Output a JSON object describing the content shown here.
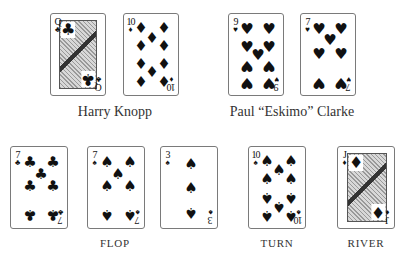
{
  "players": [
    {
      "name": "Harry Knopp",
      "cards": [
        {
          "rank": "Q",
          "suit": "clubs",
          "suit_glyph": "♣",
          "face": true
        },
        {
          "rank": "10",
          "suit": "diamonds",
          "suit_glyph": "♦",
          "face": false
        }
      ]
    },
    {
      "name": "Paul “Eskimo” Clarke",
      "cards": [
        {
          "rank": "9",
          "suit": "hearts",
          "suit_glyph": "♥",
          "face": false
        },
        {
          "rank": "7",
          "suit": "hearts",
          "suit_glyph": "♥",
          "face": false
        }
      ]
    }
  ],
  "board": {
    "flop": {
      "label": "FLOP",
      "cards": [
        {
          "rank": "7",
          "suit": "clubs",
          "suit_glyph": "♣"
        },
        {
          "rank": "7",
          "suit": "spades",
          "suit_glyph": "♠"
        },
        {
          "rank": "3",
          "suit": "spades",
          "suit_glyph": "♠"
        }
      ]
    },
    "turn": {
      "label": "TURN",
      "cards": [
        {
          "rank": "10",
          "suit": "spades",
          "suit_glyph": "♠"
        }
      ]
    },
    "river": {
      "label": "RIVER",
      "cards": [
        {
          "rank": "J",
          "suit": "diamonds",
          "suit_glyph": "♦",
          "face": true
        }
      ]
    }
  }
}
